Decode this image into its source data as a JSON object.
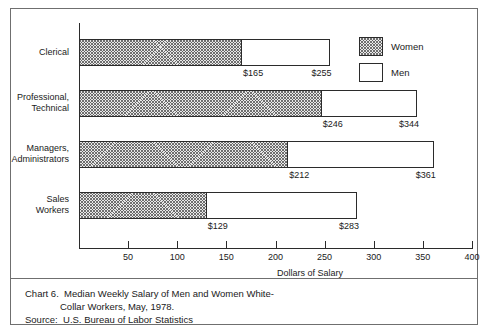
{
  "chart_data": {
    "type": "bar",
    "orientation": "horizontal",
    "stacked": true,
    "xlabel": "Dollars of Salary",
    "ylabel": "",
    "xlim": [
      0,
      400
    ],
    "xticks": [
      0,
      50,
      100,
      150,
      200,
      250,
      300,
      350,
      400
    ],
    "xticklabels": [
      "",
      "50",
      "100",
      "150",
      "200",
      "250",
      "300",
      "350",
      "400"
    ],
    "grid": false,
    "legend_position": "top-right",
    "categories": [
      "Clerical",
      "Professional, Technical",
      "Managers, Administrators",
      "Sales Workers"
    ],
    "series": [
      {
        "name": "Women",
        "values": [
          165,
          246,
          212,
          129
        ],
        "fill": "hatched"
      },
      {
        "name": "Men",
        "values": [
          255,
          344,
          361,
          283
        ],
        "fill": "white"
      }
    ],
    "data_labels": {
      "women": [
        "$165",
        "$246",
        "$212",
        "$129"
      ],
      "men": [
        "$255",
        "$344",
        "$361",
        "$283"
      ]
    }
  },
  "chart": {
    "axis": {
      "xtitle": "Dollars of Salary",
      "ticks": [
        {
          "value": 0,
          "label": ""
        },
        {
          "value": 50,
          "label": "50"
        },
        {
          "value": 100,
          "label": "100"
        },
        {
          "value": 150,
          "label": "150"
        },
        {
          "value": 200,
          "label": "200"
        },
        {
          "value": 250,
          "label": "250"
        },
        {
          "value": 300,
          "label": "300"
        },
        {
          "value": 350,
          "label": "350"
        },
        {
          "value": 400,
          "label": "400"
        }
      ]
    },
    "rows": [
      {
        "category_line1": "Clerical",
        "category_line2": "",
        "women_value": 165,
        "men_value": 255,
        "women_label": "$165",
        "men_label": "$255"
      },
      {
        "category_line1": "Professional,",
        "category_line2": "Technical",
        "women_value": 246,
        "men_value": 344,
        "women_label": "$246",
        "men_label": "$344"
      },
      {
        "category_line1": "Managers,",
        "category_line2": "Administrators",
        "women_value": 212,
        "men_value": 361,
        "women_label": "$212",
        "men_label": "$361"
      },
      {
        "category_line1": "Sales",
        "category_line2": "Workers",
        "women_value": 129,
        "men_value": 283,
        "women_label": "$129",
        "men_label": "$283"
      }
    ],
    "legend": [
      {
        "label": "Women",
        "fill": "hatched"
      },
      {
        "label": "Men",
        "fill": "white"
      }
    ]
  },
  "caption": {
    "line1": "Chart 6.  Median Weekly Salary of Men and Women White-",
    "line2": "Collar Workers, May, 1978.",
    "line3": "Source:  U.S. Bureau of Labor Statistics"
  },
  "colors": {
    "ink": "#1a1a1a",
    "rule": "#6f6f6f",
    "axis": "#2b2b2b",
    "hatch_fill": "#e8e8e8",
    "background": "#ffffff"
  }
}
